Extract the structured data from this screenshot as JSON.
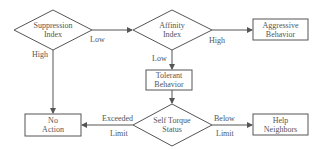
{
  "diagram": {
    "type": "flowchart",
    "colors": {
      "stroke": "#555555",
      "text": "#555555",
      "background": "#ffffff"
    },
    "nodes": {
      "suppression": {
        "shape": "diamond",
        "line1": "Suppression",
        "line2": "Index"
      },
      "affinity": {
        "shape": "diamond",
        "line1": "Affinity",
        "line2": "Index"
      },
      "aggressive": {
        "shape": "rectangle",
        "line1": "Aggressive",
        "line2": "Behavior"
      },
      "tolerant": {
        "shape": "rectangle",
        "line1": "Tolerant",
        "line2": "Behavior"
      },
      "self_torque": {
        "shape": "diamond",
        "line1": "Self Torque",
        "line2": "Status"
      },
      "no_action": {
        "shape": "rectangle",
        "line1": "No",
        "line2": "Action"
      },
      "help_neighbors": {
        "shape": "rectangle",
        "line1": "Help",
        "line2": "Neighbors"
      }
    },
    "edges": [
      {
        "from": "suppression",
        "to": "affinity",
        "label": "Low"
      },
      {
        "from": "suppression",
        "to": "no_action",
        "label": "High"
      },
      {
        "from": "affinity",
        "to": "aggressive",
        "label": "High"
      },
      {
        "from": "affinity",
        "to": "tolerant",
        "label": "Low"
      },
      {
        "from": "tolerant",
        "to": "self_torque",
        "label": ""
      },
      {
        "from": "self_torque",
        "to": "no_action",
        "label_line1": "Exceeded",
        "label_line2": "Limit"
      },
      {
        "from": "self_torque",
        "to": "help_neighbors",
        "label_line1": "Below",
        "label_line2": "Limit"
      }
    ]
  }
}
